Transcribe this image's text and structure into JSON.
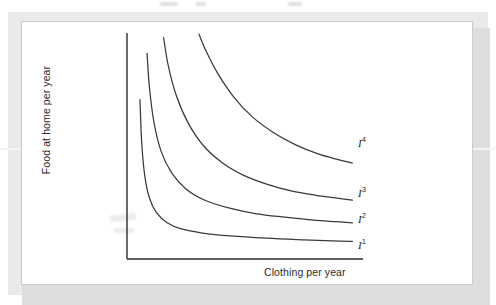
{
  "figure": {
    "background_color": "#ffffff",
    "frame_color": "#e9eaec",
    "card_color": "#ffffff",
    "line_color": "#3a3a3a",
    "axis_color": "#2b2b2b"
  },
  "chart_data": {
    "type": "line",
    "title": "",
    "subtitle": "",
    "xlabel": "Clothing per year",
    "ylabel": "Food at home per year",
    "grid": false,
    "legend_position": "inline-right-end-of-curve",
    "axis_ticks": [],
    "xlim": [
      0,
      10
    ],
    "ylim": [
      0,
      10
    ],
    "annotations": [],
    "series": [
      {
        "name": "I1",
        "label": "I",
        "superscript": "1",
        "description": "Lowest indifference curve, convex to the origin",
        "x": [
          0.55,
          0.62,
          0.75,
          0.95,
          1.25,
          1.7,
          2.3,
          3.2,
          4.4,
          5.9,
          7.4,
          8.7,
          9.55
        ],
        "y": [
          7.05,
          5.2,
          3.7,
          2.7,
          2.05,
          1.6,
          1.33,
          1.15,
          1.02,
          0.92,
          0.85,
          0.8,
          0.78
        ]
      },
      {
        "name": "I2",
        "label": "I",
        "superscript": "2",
        "description": "Second indifference curve, higher utility than I1",
        "x": [
          0.85,
          0.95,
          1.15,
          1.45,
          1.9,
          2.5,
          3.3,
          4.35,
          5.5,
          6.7,
          7.9,
          8.9,
          9.55
        ],
        "y": [
          9.1,
          7.6,
          6.0,
          4.75,
          3.8,
          3.1,
          2.6,
          2.25,
          2.0,
          1.85,
          1.72,
          1.65,
          1.6
        ]
      },
      {
        "name": "I3",
        "label": "I",
        "superscript": "3",
        "description": "Third indifference curve, higher utility than I2",
        "x": [
          1.55,
          1.75,
          2.1,
          2.6,
          3.25,
          4.05,
          4.95,
          5.95,
          7.0,
          8.0,
          8.85,
          9.55
        ],
        "y": [
          9.8,
          8.55,
          7.2,
          6.0,
          5.0,
          4.25,
          3.7,
          3.3,
          3.0,
          2.82,
          2.7,
          2.6
        ]
      },
      {
        "name": "I4",
        "label": "I",
        "superscript": "4",
        "description": "Highest indifference curve, greatest utility",
        "x": [
          3.05,
          3.35,
          3.85,
          4.5,
          5.3,
          6.2,
          7.15,
          8.1,
          8.95,
          9.55
        ],
        "y": [
          9.95,
          9.2,
          8.2,
          7.2,
          6.3,
          5.6,
          5.05,
          4.65,
          4.4,
          4.25
        ]
      }
    ]
  },
  "labels": {
    "y_axis_title": "Food at home per year",
    "x_axis_title": "Clothing per year",
    "curve_1": "I",
    "curve_1_sup": "1",
    "curve_2": "I",
    "curve_2_sup": "2",
    "curve_3": "I",
    "curve_3_sup": "3",
    "curve_4": "I",
    "curve_4_sup": "4"
  }
}
